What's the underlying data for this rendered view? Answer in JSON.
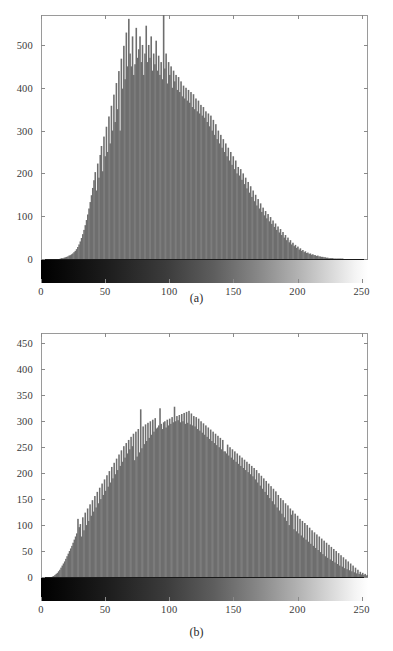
{
  "figure": {
    "background": "#ffffff",
    "bar_color": "#6e6e6e",
    "axis_color": "#9a9a9a",
    "tick_text_color": "#3a3a3a"
  },
  "panels": [
    {
      "id": "a",
      "caption": "(a)",
      "colorbar": {
        "from": "#000000",
        "to": "#ffffff",
        "label": "grayscale-intensity-ramp"
      },
      "chart_data": {
        "type": "bar",
        "title": "",
        "xlabel": "",
        "ylabel": "",
        "xlim": [
          0,
          255
        ],
        "ylim": [
          0,
          570
        ],
        "grid": false,
        "legend": null,
        "xticks": [
          0,
          50,
          100,
          150,
          200,
          250
        ],
        "yticks": [
          0,
          100,
          200,
          300,
          400,
          500
        ],
        "x": [
          0,
          1,
          2,
          3,
          4,
          5,
          6,
          7,
          8,
          9,
          10,
          11,
          12,
          13,
          14,
          15,
          16,
          17,
          18,
          19,
          20,
          21,
          22,
          23,
          24,
          25,
          26,
          27,
          28,
          29,
          30,
          31,
          32,
          33,
          34,
          35,
          36,
          37,
          38,
          39,
          40,
          41,
          42,
          43,
          44,
          45,
          46,
          47,
          48,
          49,
          50,
          51,
          52,
          53,
          54,
          55,
          56,
          57,
          58,
          59,
          60,
          61,
          62,
          63,
          64,
          65,
          66,
          67,
          68,
          69,
          70,
          71,
          72,
          73,
          74,
          75,
          76,
          77,
          78,
          79,
          80,
          81,
          82,
          83,
          84,
          85,
          86,
          87,
          88,
          89,
          90,
          91,
          92,
          93,
          94,
          95,
          96,
          97,
          98,
          99,
          100,
          101,
          102,
          103,
          104,
          105,
          106,
          107,
          108,
          109,
          110,
          111,
          112,
          113,
          114,
          115,
          116,
          117,
          118,
          119,
          120,
          121,
          122,
          123,
          124,
          125,
          126,
          127,
          128,
          129,
          130,
          131,
          132,
          133,
          134,
          135,
          136,
          137,
          138,
          139,
          140,
          141,
          142,
          143,
          144,
          145,
          146,
          147,
          148,
          149,
          150,
          151,
          152,
          153,
          154,
          155,
          156,
          157,
          158,
          159,
          160,
          161,
          162,
          163,
          164,
          165,
          166,
          167,
          168,
          169,
          170,
          171,
          172,
          173,
          174,
          175,
          176,
          177,
          178,
          179,
          180,
          181,
          182,
          183,
          184,
          185,
          186,
          187,
          188,
          189,
          190,
          191,
          192,
          193,
          194,
          195,
          196,
          197,
          198,
          199,
          200,
          201,
          202,
          203,
          204,
          205,
          206,
          207,
          208,
          209,
          210,
          211,
          212,
          213,
          214,
          215,
          216,
          217,
          218,
          219,
          220,
          221,
          222,
          223,
          224,
          225,
          226,
          227,
          228,
          229,
          230,
          231,
          232,
          233,
          234,
          235,
          236,
          237,
          238,
          239,
          240,
          241,
          242,
          243,
          244,
          245,
          246,
          247,
          248,
          249,
          250,
          251,
          252,
          253,
          254,
          255
        ],
        "values": [
          0,
          0,
          0,
          0,
          0,
          0,
          0,
          0,
          0,
          0,
          0,
          0,
          0,
          0,
          0,
          1,
          2,
          2,
          3,
          4,
          5,
          6,
          8,
          9,
          11,
          13,
          16,
          19,
          23,
          28,
          34,
          41,
          49,
          58,
          68,
          79,
          91,
          104,
          118,
          133,
          149,
          166,
          184,
          203,
          160,
          223,
          190,
          243,
          264,
          205,
          286,
          240,
          309,
          250,
          333,
          270,
          358,
          300,
          384,
          320,
          411,
          350,
          439,
          300,
          468,
          398,
          498,
          420,
          529,
          450,
          561,
          480,
          450,
          520,
          430,
          455,
          540,
          470,
          490,
          520,
          460,
          500,
          430,
          480,
          545,
          460,
          500,
          470,
          520,
          440,
          480,
          455,
          510,
          440,
          475,
          430,
          460,
          420,
          570,
          445,
          480,
          410,
          460,
          430,
          450,
          400,
          440,
          415,
          430,
          395,
          425,
          390,
          415,
          380,
          405,
          375,
          400,
          370,
          395,
          365,
          390,
          355,
          385,
          350,
          375,
          345,
          370,
          340,
          360,
          335,
          355,
          330,
          345,
          320,
          340,
          310,
          335,
          300,
          325,
          290,
          315,
          280,
          300,
          270,
          290,
          260,
          280,
          250,
          270,
          240,
          260,
          230,
          250,
          220,
          240,
          210,
          230,
          200,
          215,
          195,
          210,
          185,
          200,
          175,
          190,
          165,
          180,
          155,
          170,
          145,
          160,
          135,
          150,
          125,
          140,
          118,
          130,
          110,
          120,
          102,
          112,
          95,
          105,
          88,
          98,
          82,
          90,
          75,
          83,
          68,
          76,
          62,
          70,
          56,
          63,
          50,
          56,
          44,
          50,
          39,
          44,
          34,
          38,
          30,
          33,
          26,
          29,
          22,
          25,
          19,
          21,
          16,
          18,
          14,
          15,
          12,
          13,
          10,
          11,
          9,
          9,
          7,
          8,
          6,
          6,
          5,
          5,
          4,
          4,
          3,
          3,
          2,
          2,
          2,
          2,
          1,
          1,
          1,
          1,
          1,
          1,
          1,
          1,
          0,
          0,
          0,
          0,
          0,
          0,
          0,
          0,
          0,
          0,
          0,
          0,
          0,
          0,
          0,
          0,
          0,
          0,
          0,
          0
        ]
      }
    },
    {
      "id": "b",
      "caption": "(b)",
      "colorbar": {
        "from": "#000000",
        "to": "#ffffff",
        "label": "grayscale-intensity-ramp"
      },
      "chart_data": {
        "type": "bar",
        "title": "",
        "xlabel": "",
        "ylabel": "",
        "xlim": [
          0,
          255
        ],
        "ylim": [
          0,
          470
        ],
        "grid": false,
        "legend": null,
        "xticks": [
          0,
          50,
          100,
          150,
          200,
          250
        ],
        "yticks": [
          0,
          50,
          100,
          150,
          200,
          250,
          300,
          350,
          400,
          450
        ],
        "x": [
          0,
          1,
          2,
          3,
          4,
          5,
          6,
          7,
          8,
          9,
          10,
          11,
          12,
          13,
          14,
          15,
          16,
          17,
          18,
          19,
          20,
          21,
          22,
          23,
          24,
          25,
          26,
          27,
          28,
          29,
          30,
          31,
          32,
          33,
          34,
          35,
          36,
          37,
          38,
          39,
          40,
          41,
          42,
          43,
          44,
          45,
          46,
          47,
          48,
          49,
          50,
          51,
          52,
          53,
          54,
          55,
          56,
          57,
          58,
          59,
          60,
          61,
          62,
          63,
          64,
          65,
          66,
          67,
          68,
          69,
          70,
          71,
          72,
          73,
          74,
          75,
          76,
          77,
          78,
          79,
          80,
          81,
          82,
          83,
          84,
          85,
          86,
          87,
          88,
          89,
          90,
          91,
          92,
          93,
          94,
          95,
          96,
          97,
          98,
          99,
          100,
          101,
          102,
          103,
          104,
          105,
          106,
          107,
          108,
          109,
          110,
          111,
          112,
          113,
          114,
          115,
          116,
          117,
          118,
          119,
          120,
          121,
          122,
          123,
          124,
          125,
          126,
          127,
          128,
          129,
          130,
          131,
          132,
          133,
          134,
          135,
          136,
          137,
          138,
          139,
          140,
          141,
          142,
          143,
          144,
          145,
          146,
          147,
          148,
          149,
          150,
          151,
          152,
          153,
          154,
          155,
          156,
          157,
          158,
          159,
          160,
          161,
          162,
          163,
          164,
          165,
          166,
          167,
          168,
          169,
          170,
          171,
          172,
          173,
          174,
          175,
          176,
          177,
          178,
          179,
          180,
          181,
          182,
          183,
          184,
          185,
          186,
          187,
          188,
          189,
          190,
          191,
          192,
          193,
          194,
          195,
          196,
          197,
          198,
          199,
          200,
          201,
          202,
          203,
          204,
          205,
          206,
          207,
          208,
          209,
          210,
          211,
          212,
          213,
          214,
          215,
          216,
          217,
          218,
          219,
          220,
          221,
          222,
          223,
          224,
          225,
          226,
          227,
          228,
          229,
          230,
          231,
          232,
          233,
          234,
          235,
          236,
          237,
          238,
          239,
          240,
          241,
          242,
          243,
          244,
          245,
          246,
          247,
          248,
          249,
          250,
          251,
          252,
          253,
          254,
          255
        ],
        "values": [
          0,
          0,
          0,
          0,
          0,
          0,
          0,
          0,
          0,
          1,
          2,
          4,
          6,
          8,
          11,
          14,
          18,
          22,
          26,
          30,
          35,
          40,
          45,
          50,
          55,
          60,
          66,
          72,
          78,
          84,
          112,
          96,
          102,
          78,
          115,
          90,
          124,
          100,
          132,
          108,
          140,
          118,
          148,
          126,
          156,
          134,
          164,
          142,
          172,
          150,
          180,
          158,
          188,
          166,
          196,
          174,
          204,
          182,
          212,
          190,
          220,
          198,
          228,
          206,
          236,
          214,
          244,
          222,
          252,
          230,
          258,
          238,
          264,
          246,
          270,
          252,
          276,
          225,
          280,
          232,
          285,
          240,
          323,
          248,
          290,
          256,
          294,
          262,
          297,
          268,
          300,
          274,
          303,
          280,
          306,
          286,
          288,
          292,
          325,
          295,
          285,
          298,
          300,
          288,
          303,
          292,
          305,
          295,
          308,
          298,
          328,
          300,
          310,
          302,
          312,
          298,
          314,
          300,
          316,
          295,
          318,
          297,
          320,
          294,
          315,
          292,
          310,
          290,
          308,
          285,
          305,
          282,
          300,
          278,
          296,
          274,
          292,
          270,
          288,
          266,
          284,
          262,
          280,
          258,
          276,
          254,
          272,
          250,
          268,
          246,
          264,
          242,
          242,
          238,
          255,
          234,
          250,
          230,
          246,
          226,
          242,
          222,
          238,
          218,
          234,
          214,
          230,
          210,
          226,
          206,
          222,
          202,
          218,
          198,
          214,
          194,
          210,
          188,
          206,
          182,
          200,
          176,
          195,
          170,
          190,
          164,
          185,
          158,
          180,
          152,
          175,
          146,
          170,
          140,
          165,
          134,
          158,
          128,
          152,
          122,
          148,
          115,
          142,
          108,
          138,
          100,
          132,
          120,
          128,
          92,
          122,
          88,
          118,
          84,
          112,
          80,
          108,
          76,
          104,
          72,
          100,
          68,
          95,
          64,
          90,
          60,
          86,
          56,
          82,
          52,
          78,
          48,
          74,
          44,
          70,
          40,
          66,
          37,
          62,
          34,
          58,
          31,
          54,
          28,
          50,
          25,
          46,
          22,
          42,
          20,
          38,
          17,
          34,
          15,
          30,
          13,
          26,
          11,
          22,
          9,
          18,
          7,
          14,
          6,
          10,
          5,
          8,
          4,
          6,
          3,
          4
        ]
      }
    }
  ]
}
